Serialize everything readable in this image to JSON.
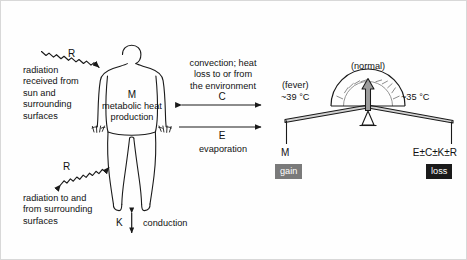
{
  "figure": {
    "background_color": "#fefefe",
    "border_color": "#d8d8d8",
    "line_color": "#1a1a1a"
  },
  "left": {
    "radiation_in_symbol": "R",
    "radiation_in_caption": "radiation\nreceived from\nsun and\nsurrounding\nsurfaces",
    "radiation_out_symbol": "R",
    "radiation_out_caption": "radiation to and\nfrom surrounding\nsurfaces"
  },
  "body": {
    "symbol": "M",
    "caption": "metabolic heat\nproduction"
  },
  "bottom": {
    "conduction_symbol": "K",
    "conduction_label": "conduction"
  },
  "middle": {
    "convection_caption": "convection; heat\nloss to or from\nthe environment",
    "convection_symbol": "C",
    "evaporation_symbol": "E",
    "evaporation_label": "evaporation"
  },
  "balance": {
    "dial_label": "(normal)",
    "left_state": "(fever)",
    "left_temperature": "~39 °C",
    "right_temperature": "~35 °C",
    "left_pan_symbol": "M",
    "right_pan_symbol": "E±C±K±R",
    "gain_badge": "gain",
    "loss_badge": "loss",
    "gain_badge_color": "#7a7a7a",
    "loss_badge_color": "#1a1a1a"
  }
}
